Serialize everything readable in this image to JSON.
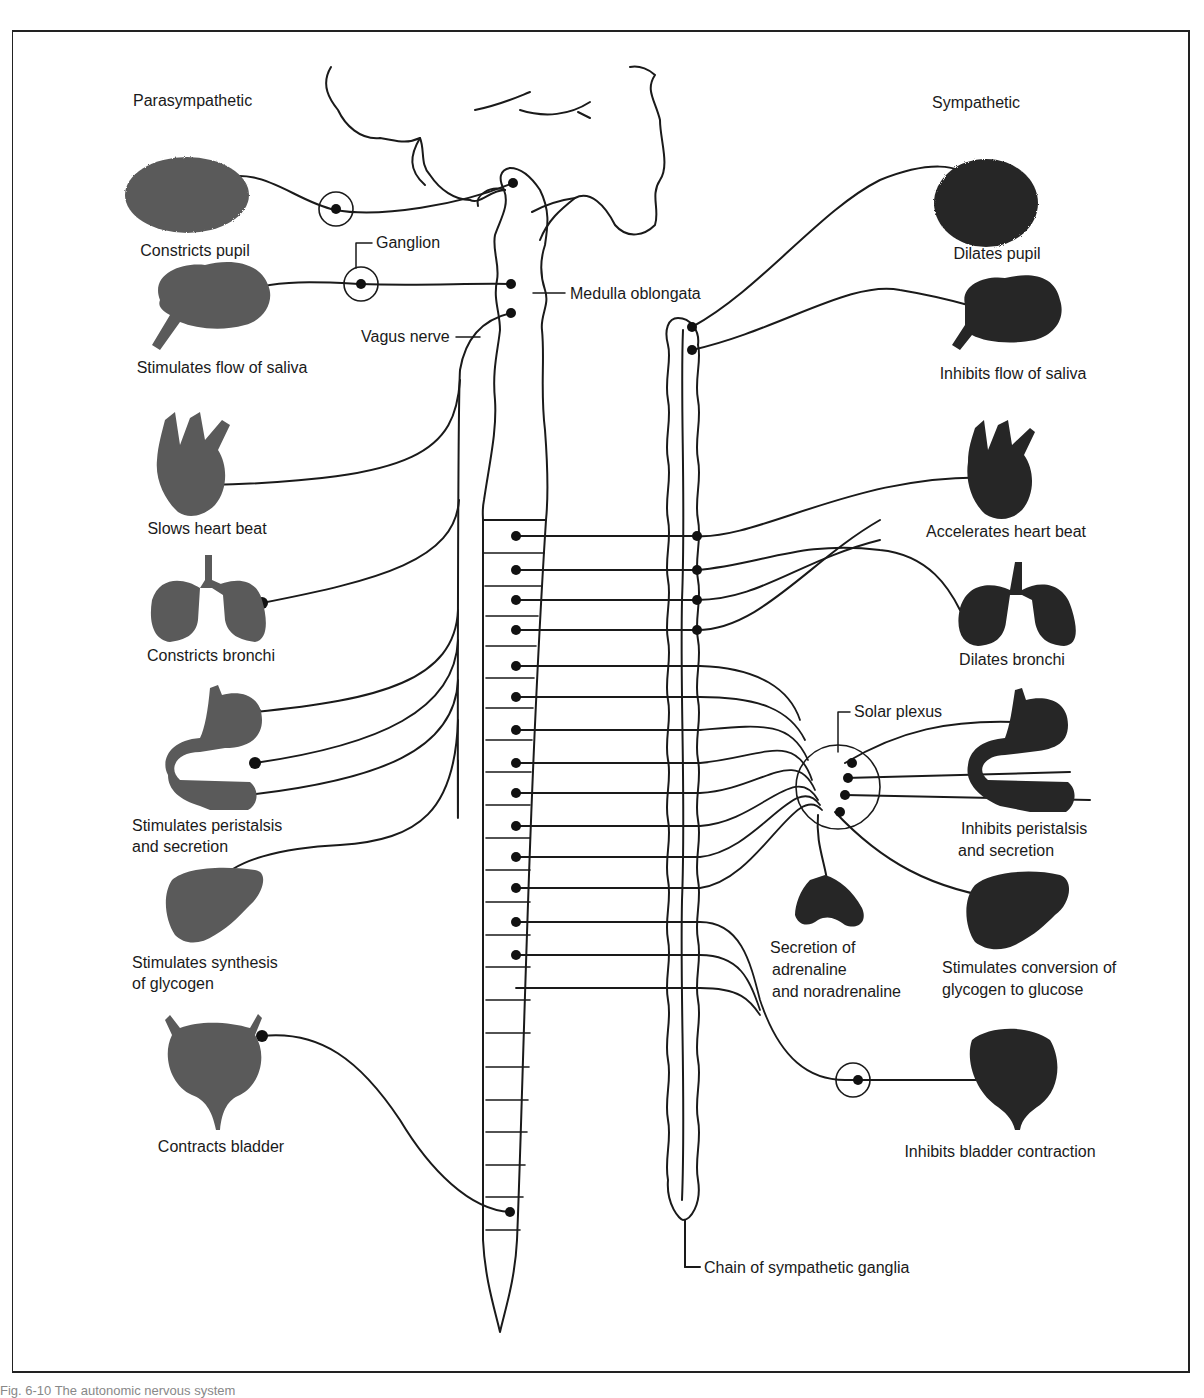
{
  "figure": {
    "caption": "Fig. 6-10  The autonomic nervous system",
    "columns": {
      "left": "Parasympathetic",
      "right": "Sympathetic"
    },
    "colors": {
      "ink": "#1a1a1a",
      "parasympathetic_organ": "#5a5a5a",
      "sympathetic_organ": "#262626",
      "background": "#ffffff"
    }
  },
  "structures": {
    "ganglion": "Ganglion",
    "medulla": "Medulla oblongata",
    "vagus": "Vagus nerve",
    "solar_plexus": "Solar plexus",
    "sympathetic_chain": "Chain of sympathetic ganglia"
  },
  "parasympathetic": [
    {
      "organ": "eye",
      "line1": "Constricts pupil"
    },
    {
      "organ": "salivary-gland",
      "line1": "Stimulates flow of saliva"
    },
    {
      "organ": "heart",
      "line1": "Slows heart beat"
    },
    {
      "organ": "lungs",
      "line1": "Constricts bronchi"
    },
    {
      "organ": "stomach-intestines",
      "line1": "Stimulates peristalsis",
      "line2": "and secretion"
    },
    {
      "organ": "liver",
      "line1": "Stimulates synthesis",
      "line2": "of glycogen"
    },
    {
      "organ": "bladder",
      "line1": "Contracts bladder"
    }
  ],
  "sympathetic": [
    {
      "organ": "eye",
      "line1": "Dilates pupil"
    },
    {
      "organ": "salivary-gland",
      "line1": "Inhibits flow of saliva"
    },
    {
      "organ": "heart",
      "line1": "Accelerates heart beat"
    },
    {
      "organ": "lungs",
      "line1": "Dilates bronchi"
    },
    {
      "organ": "stomach-intestines",
      "line1": "Inhibits peristalsis",
      "line2": "and secretion"
    },
    {
      "organ": "adrenal-gland",
      "line1": "Secretion of",
      "line2": "adrenaline",
      "line3": "and noradrenaline"
    },
    {
      "organ": "liver",
      "line1": "Stimulates conversion of",
      "line2": "glycogen to glucose"
    },
    {
      "organ": "bladder",
      "line1": "Inhibits bladder contraction"
    }
  ]
}
